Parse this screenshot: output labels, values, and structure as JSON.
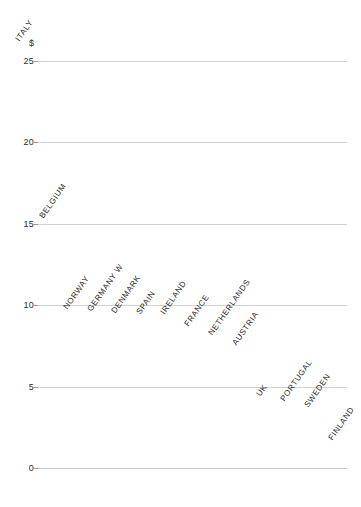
{
  "chart_data": {
    "type": "bar",
    "title": "",
    "subtitle": "",
    "xlabel": "",
    "ylabel": "$",
    "currency_symbol": "$",
    "ylim": [
      0,
      26.5
    ],
    "yticks": [
      0,
      5,
      10,
      15,
      20,
      25
    ],
    "ytick_labels": [
      "0",
      "5",
      "10",
      "15",
      "20",
      "25"
    ],
    "grid": true,
    "legend": "none",
    "style": "3d-bars",
    "bar_color": "#9e9e9e",
    "bar_top_color": "#cfcfcf",
    "bar_side_color": "#c4c4c4",
    "gridline_color": "#d2d2d2",
    "categories": [
      "ITALY",
      "BELGIUM",
      "NORWAY",
      "GERMANY W",
      "DENMARK",
      "SPAIN",
      "IRELAND",
      "FRANCE",
      "NETHERLANDS",
      "AUSTRIA",
      "UK",
      "PORTUGAL",
      "SWEDEN",
      "FINLAND"
    ],
    "values": [
      26.0,
      15.1,
      9.5,
      9.4,
      9.3,
      9.2,
      9.2,
      8.5,
      7.9,
      7.3,
      4.2,
      3.9,
      3.5,
      1.5
    ]
  }
}
